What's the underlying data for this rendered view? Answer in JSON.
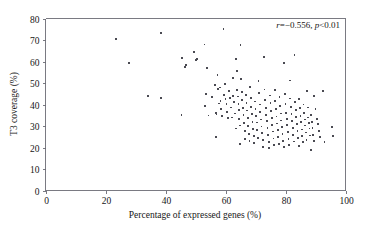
{
  "chart_data": {
    "type": "scatter",
    "title": "",
    "xlabel": "Percentage of expressed genes (%)",
    "ylabel": "T3 coverage (%)",
    "xlim": [
      0,
      100
    ],
    "ylim": [
      0,
      80
    ],
    "xticks": [
      0,
      20,
      40,
      60,
      80,
      100
    ],
    "yticks": [
      0,
      10,
      20,
      30,
      40,
      50,
      60,
      70,
      80
    ],
    "grid": false,
    "legend": null,
    "marker": {
      "shape": "square",
      "size_px": 1.8,
      "color": "#4a4a52"
    },
    "annotations": [
      {
        "name": "correlation-stats",
        "text": "r=−0.556, p<0.01",
        "r": -0.556,
        "p_text": "p<0.01",
        "x_data": 86,
        "y_data": 77.5
      }
    ],
    "series": [
      {
        "name": "samples",
        "color": "#4a4a52",
        "points": [
          [
            23.6,
            70.6
          ],
          [
            27.8,
            59.4
          ],
          [
            34.2,
            44.0
          ],
          [
            38.4,
            73.2
          ],
          [
            38.6,
            43.0
          ],
          [
            45.3,
            35.1
          ],
          [
            45.6,
            61.6
          ],
          [
            46.4,
            57.6
          ],
          [
            46.9,
            58.5
          ],
          [
            49.6,
            64.4
          ],
          [
            50.2,
            60.8
          ],
          [
            50.4,
            61.2
          ],
          [
            53.0,
            67.9
          ],
          [
            53.2,
            39.4
          ],
          [
            53.6,
            44.8
          ],
          [
            53.9,
            57.1
          ],
          [
            54.3,
            34.9
          ],
          [
            55.6,
            43.5
          ],
          [
            56.4,
            48.9
          ],
          [
            56.7,
            25.0
          ],
          [
            56.8,
            36.0
          ],
          [
            57.0,
            35.4
          ],
          [
            57.3,
            53.9
          ],
          [
            57.6,
            47.2
          ],
          [
            57.9,
            40.5
          ],
          [
            58.1,
            47.9
          ],
          [
            58.3,
            41.8
          ],
          [
            58.6,
            38.0
          ],
          [
            58.9,
            34.6
          ],
          [
            59.3,
            75.1
          ],
          [
            59.5,
            44.6
          ],
          [
            59.8,
            49.6
          ],
          [
            60.0,
            42.6
          ],
          [
            60.3,
            40.1
          ],
          [
            60.6,
            36.6
          ],
          [
            60.9,
            33.8
          ],
          [
            61.2,
            46.1
          ],
          [
            61.5,
            43.2
          ],
          [
            61.8,
            38.6
          ],
          [
            62.1,
            34.0
          ],
          [
            62.4,
            52.4
          ],
          [
            62.6,
            44.0
          ],
          [
            62.9,
            41.0
          ],
          [
            63.1,
            35.8
          ],
          [
            63.4,
            28.8
          ],
          [
            63.5,
            61.0
          ],
          [
            63.7,
            55.4
          ],
          [
            63.9,
            46.6
          ],
          [
            64.1,
            43.7
          ],
          [
            64.3,
            40.4
          ],
          [
            64.4,
            37.6
          ],
          [
            64.6,
            33.4
          ],
          [
            64.8,
            30.2
          ],
          [
            64.9,
            21.5
          ],
          [
            65.0,
            67.5
          ],
          [
            65.2,
            52.0
          ],
          [
            65.4,
            46.0
          ],
          [
            65.6,
            42.0
          ],
          [
            65.8,
            38.2
          ],
          [
            66.0,
            35.0
          ],
          [
            66.2,
            31.4
          ],
          [
            66.4,
            27.6
          ],
          [
            66.6,
            23.8
          ],
          [
            66.8,
            44.4
          ],
          [
            67.0,
            40.8
          ],
          [
            67.2,
            37.2
          ],
          [
            67.4,
            33.6
          ],
          [
            67.6,
            30.0
          ],
          [
            67.8,
            26.4
          ],
          [
            68.0,
            22.9
          ],
          [
            68.2,
            48.2
          ],
          [
            68.4,
            43.0
          ],
          [
            68.6,
            39.0
          ],
          [
            68.8,
            35.6
          ],
          [
            69.0,
            32.0
          ],
          [
            69.2,
            28.6
          ],
          [
            69.4,
            25.2
          ],
          [
            69.6,
            22.2
          ],
          [
            69.8,
            41.4
          ],
          [
            70.0,
            38.0
          ],
          [
            70.2,
            34.8
          ],
          [
            70.4,
            31.6
          ],
          [
            70.6,
            28.2
          ],
          [
            70.8,
            24.6
          ],
          [
            71.0,
            51.0
          ],
          [
            71.2,
            45.2
          ],
          [
            71.4,
            40.0
          ],
          [
            71.6,
            36.4
          ],
          [
            71.8,
            33.0
          ],
          [
            72.0,
            29.8
          ],
          [
            72.2,
            26.6
          ],
          [
            72.4,
            23.4
          ],
          [
            72.6,
            20.2
          ],
          [
            72.8,
            62.2
          ],
          [
            73.0,
            47.0
          ],
          [
            73.2,
            42.2
          ],
          [
            73.4,
            38.4
          ],
          [
            73.6,
            35.2
          ],
          [
            73.8,
            32.2
          ],
          [
            74.0,
            29.0
          ],
          [
            74.2,
            25.8
          ],
          [
            74.4,
            22.6
          ],
          [
            74.6,
            19.8
          ],
          [
            74.8,
            44.2
          ],
          [
            75.0,
            40.6
          ],
          [
            75.2,
            37.0
          ],
          [
            75.4,
            33.8
          ],
          [
            75.6,
            30.6
          ],
          [
            75.8,
            27.4
          ],
          [
            76.0,
            24.2
          ],
          [
            76.2,
            21.2
          ],
          [
            76.4,
            46.8
          ],
          [
            76.6,
            41.6
          ],
          [
            76.8,
            37.8
          ],
          [
            77.0,
            34.4
          ],
          [
            77.2,
            31.2
          ],
          [
            77.4,
            28.0
          ],
          [
            77.6,
            24.8
          ],
          [
            77.8,
            21.8
          ],
          [
            78.0,
            43.4
          ],
          [
            78.2,
            39.2
          ],
          [
            78.4,
            35.8
          ],
          [
            78.6,
            32.6
          ],
          [
            78.8,
            29.4
          ],
          [
            79.0,
            26.2
          ],
          [
            79.2,
            23.0
          ],
          [
            79.4,
            20.4
          ],
          [
            79.6,
            59.3
          ],
          [
            79.8,
            45.0
          ],
          [
            80.0,
            40.2
          ],
          [
            80.2,
            36.2
          ],
          [
            80.4,
            33.2
          ],
          [
            80.6,
            30.4
          ],
          [
            80.8,
            27.2
          ],
          [
            81.0,
            24.0
          ],
          [
            81.2,
            21.0
          ],
          [
            81.4,
            51.2
          ],
          [
            81.6,
            42.8
          ],
          [
            81.8,
            38.8
          ],
          [
            82.0,
            35.4
          ],
          [
            82.2,
            32.4
          ],
          [
            82.4,
            29.2
          ],
          [
            82.6,
            26.0
          ],
          [
            82.8,
            22.8
          ],
          [
            83.0,
            63.2
          ],
          [
            83.2,
            41.2
          ],
          [
            83.4,
            37.4
          ],
          [
            83.6,
            34.2
          ],
          [
            83.8,
            31.0
          ],
          [
            84.0,
            27.8
          ],
          [
            84.2,
            24.4
          ],
          [
            84.4,
            20.8
          ],
          [
            84.6,
            42.4
          ],
          [
            84.8,
            38.2
          ],
          [
            85.0,
            34.8
          ],
          [
            85.2,
            31.8
          ],
          [
            85.4,
            28.4
          ],
          [
            85.6,
            25.4
          ],
          [
            85.8,
            22.4
          ],
          [
            86.0,
            40.0
          ],
          [
            86.2,
            36.0
          ],
          [
            86.4,
            33.0
          ],
          [
            86.6,
            30.2
          ],
          [
            86.8,
            27.0
          ],
          [
            87.0,
            23.6
          ],
          [
            87.2,
            46.2
          ],
          [
            87.4,
            38.6
          ],
          [
            87.6,
            34.0
          ],
          [
            87.8,
            31.4
          ],
          [
            88.0,
            28.8
          ],
          [
            88.2,
            25.6
          ],
          [
            88.4,
            18.8
          ],
          [
            88.6,
            35.0
          ],
          [
            88.8,
            32.0
          ],
          [
            89.0,
            29.0
          ],
          [
            89.2,
            26.0
          ],
          [
            89.4,
            23.2
          ],
          [
            89.6,
            44.0
          ],
          [
            90.0,
            38.0
          ],
          [
            90.4,
            33.4
          ],
          [
            90.8,
            30.8
          ],
          [
            91.2,
            27.6
          ],
          [
            91.6,
            24.8
          ],
          [
            92.4,
            46.4
          ],
          [
            93.0,
            22.4
          ],
          [
            95.4,
            29.4
          ],
          [
            95.8,
            25.2
          ]
        ]
      }
    ]
  },
  "axes": {
    "x_tick_labels": [
      "0",
      "20",
      "40",
      "60",
      "80",
      "100"
    ],
    "y_tick_labels": [
      "0",
      "10",
      "20",
      "30",
      "40",
      "50",
      "60",
      "70",
      "80"
    ],
    "x_axis_title": "Percentage of expressed genes (%)",
    "y_axis_title": "T3 coverage (%)"
  }
}
